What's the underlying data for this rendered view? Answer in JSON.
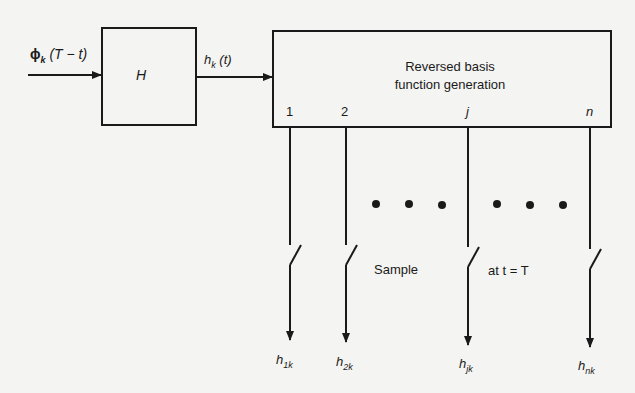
{
  "input": {
    "symbol": "ϕ",
    "sub": "k",
    "arg": "(T − t)"
  },
  "block_h": {
    "label": "H"
  },
  "middle_signal": {
    "symbol": "h",
    "sub": "k",
    "arg": "(t)"
  },
  "generator": {
    "line1": "Reversed basis",
    "line2": "function generation"
  },
  "ports": [
    "1",
    "2",
    "j",
    "n"
  ],
  "sample_label": {
    "left": "Sample",
    "right": "at t = T"
  },
  "outputs": [
    {
      "symbol": "h",
      "sub": "1k"
    },
    {
      "symbol": "h",
      "sub": "2k"
    },
    {
      "symbol": "h",
      "sub": "jk"
    },
    {
      "symbol": "h",
      "sub": "nk"
    }
  ]
}
